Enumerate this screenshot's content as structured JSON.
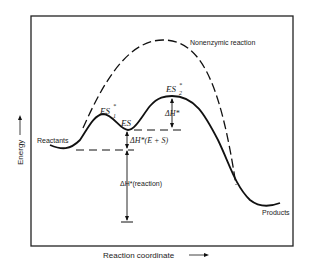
{
  "diagram": {
    "title": "",
    "axes": {
      "y_label": "Energy",
      "x_label": "Reaction coordinate"
    },
    "curves": {
      "nonenzymic_label": "Nonenzymic reaction",
      "reactants_label": "Reactants",
      "products_label": "Products"
    },
    "states": {
      "es1_label": "ES",
      "es1_sup": "*",
      "es1_sub": "1",
      "es_label": "ES",
      "es2_label": "ES",
      "es2_sup": "*",
      "es2_sub": "2"
    },
    "annotations": {
      "dh_star": "ΔH*",
      "dh_es": "ΔH*(E + S)",
      "dh_reaction": "ΔH*(reaction)"
    },
    "colors": {
      "line": "#111111",
      "background": "#ffffff"
    }
  }
}
